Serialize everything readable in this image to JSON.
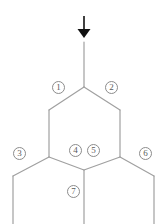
{
  "diagram": {
    "type": "skeletal-structure",
    "stroke_color": "#a0a0a0",
    "arrow_color": "#111111",
    "label_border_color": "#8c8c8c",
    "label_text_color": "#5a5a5a",
    "background_color": "#ffffff",
    "arrow": {
      "name": "down-arrow",
      "direction": "down",
      "tip_x": 84,
      "tip_y": 37,
      "tail_y": 16
    },
    "labels": [
      {
        "id": "1",
        "text": "1",
        "x": 52,
        "y": 81,
        "position": "upper-left-bond"
      },
      {
        "id": "2",
        "text": "2",
        "x": 105,
        "y": 81,
        "position": "upper-right-bond"
      },
      {
        "id": "3",
        "text": "3",
        "x": 13,
        "y": 147,
        "position": "left-branch-bond"
      },
      {
        "id": "4",
        "text": "4",
        "x": 69,
        "y": 144,
        "position": "lower-left-bond"
      },
      {
        "id": "5",
        "text": "5",
        "x": 87,
        "y": 144,
        "position": "lower-right-bond"
      },
      {
        "id": "6",
        "text": "6",
        "x": 139,
        "y": 147,
        "position": "right-branch-bond"
      },
      {
        "id": "7",
        "text": "7",
        "x": 67,
        "y": 185,
        "position": "bottom-substituent-bond"
      }
    ]
  }
}
